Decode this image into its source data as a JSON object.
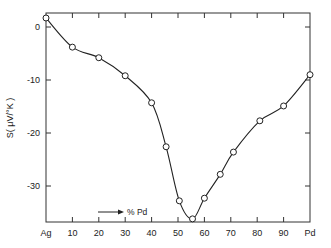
{
  "chart_data": {
    "type": "line",
    "title": "",
    "xlabel": "% Pd",
    "ylabel": "S( μV/°K )",
    "xlim": [
      0,
      100
    ],
    "ylim": [
      -37.5,
      2.5
    ],
    "grid": false,
    "legend": "none",
    "x_tick_labels": [
      {
        "x": 0,
        "label": "Ag"
      },
      {
        "x": 10,
        "label": "10"
      },
      {
        "x": 20,
        "label": "20"
      },
      {
        "x": 30,
        "label": "30"
      },
      {
        "x": 40,
        "label": "40"
      },
      {
        "x": 50,
        "label": "50"
      },
      {
        "x": 60,
        "label": "60"
      },
      {
        "x": 70,
        "label": "70"
      },
      {
        "x": 80,
        "label": "80"
      },
      {
        "x": 90,
        "label": "90"
      },
      {
        "x": 100,
        "label": "Pd"
      }
    ],
    "y_tick_labels": [
      {
        "y": 0,
        "label": "0"
      },
      {
        "y": -10,
        "label": "-10"
      },
      {
        "y": -20,
        "label": "-20"
      },
      {
        "y": -30,
        "label": "-30"
      }
    ],
    "annotation": {
      "text": "% Pd",
      "arrow": "right"
    },
    "series": [
      {
        "name": "Thermoelectric power S",
        "marker": "open-circle",
        "x": [
          0,
          10,
          20,
          30,
          40,
          45.5,
          50.5,
          55.5,
          60,
          66,
          71,
          81,
          90,
          100
        ],
        "y": [
          1.7,
          -3.8,
          -5.8,
          -9.2,
          -14.3,
          -22.6,
          -32.8,
          -36.2,
          -32.3,
          -27.8,
          -23.6,
          -17.7,
          -14.9,
          -9.0
        ]
      }
    ]
  }
}
